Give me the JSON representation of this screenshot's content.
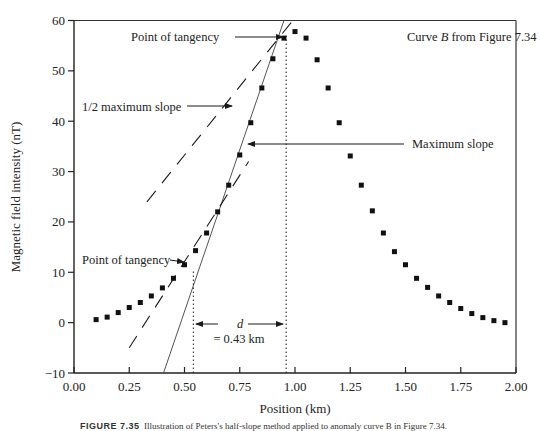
{
  "chart_data": {
    "type": "scatter",
    "title": "",
    "annotation_title": "Curve B from Figure 7.34",
    "xlabel": "Position (km)",
    "ylabel": "Magnetic field intensity (nT)",
    "xlim": [
      0,
      2.0
    ],
    "ylim": [
      -10,
      60
    ],
    "xticks": [
      0.0,
      0.25,
      0.5,
      0.75,
      1.0,
      1.25,
      1.5,
      1.75,
      2.0
    ],
    "xtick_labels": [
      "0.00",
      "0.25",
      "0.50",
      "0.75",
      "1.00",
      "1.25",
      "1.50",
      "1.75",
      "2.00"
    ],
    "yticks": [
      -10,
      0,
      10,
      20,
      30,
      40,
      50,
      60
    ],
    "ytick_labels": [
      "−10",
      "0",
      "10",
      "20",
      "30",
      "40",
      "50",
      "60"
    ],
    "grid": false,
    "series": [
      {
        "name": "Curve B",
        "marker": "square",
        "x": [
          0.1,
          0.15,
          0.2,
          0.25,
          0.3,
          0.35,
          0.4,
          0.45,
          0.5,
          0.55,
          0.6,
          0.65,
          0.7,
          0.75,
          0.8,
          0.85,
          0.9,
          0.95,
          1.0,
          1.05,
          1.1,
          1.15,
          1.2,
          1.25,
          1.3,
          1.35,
          1.4,
          1.45,
          1.5,
          1.55,
          1.6,
          1.65,
          1.7,
          1.75,
          1.8,
          1.85,
          1.9,
          1.95
        ],
        "y": [
          0.6,
          1.1,
          2.0,
          3.0,
          4.0,
          5.3,
          6.9,
          8.8,
          11.5,
          14.3,
          17.8,
          22.0,
          27.3,
          33.3,
          39.7,
          46.6,
          52.4,
          56.5,
          57.8,
          56.5,
          52.2,
          46.6,
          39.7,
          33.1,
          27.3,
          22.2,
          17.8,
          14.1,
          11.5,
          8.8,
          7.0,
          5.3,
          4.0,
          2.8,
          1.8,
          1.0,
          0.4,
          0.0
        ]
      }
    ],
    "lines": [
      {
        "name": "Maximum slope",
        "style": "solid",
        "x": [
          0.405,
          0.95
        ],
        "y": [
          -10,
          60
        ]
      },
      {
        "name": "1/2 maximum slope (upper)",
        "style": "dashed",
        "x": [
          0.33,
          0.99
        ],
        "y": [
          24,
          60
        ]
      },
      {
        "name": "1/2 maximum slope (lower)",
        "style": "dashed",
        "x": [
          0.25,
          0.79
        ],
        "y": [
          -5,
          32
        ]
      }
    ],
    "vlines": [
      {
        "x": 0.54,
        "y": [
          -10,
          10.5
        ],
        "style": "dotted"
      },
      {
        "x": 0.96,
        "y": [
          -10,
          57
        ],
        "style": "dotted"
      }
    ],
    "annotations": [
      {
        "text": "Point of tangency",
        "x": 0.95,
        "y": 56.5
      },
      {
        "text": "1/2 maximum slope",
        "x": 0.74,
        "y": 43
      },
      {
        "text": "Maximum slope",
        "x": 0.78,
        "y": 35
      },
      {
        "text": "Point of tangency",
        "x": 0.5,
        "y": 11.5
      },
      {
        "text": "d",
        "value": "= 0.43 km"
      }
    ]
  },
  "labels": {
    "curve_title_prefix": "Curve ",
    "curve_title_var": "B",
    "curve_title_suffix": " from Figure 7.34",
    "tangency_top": "Point of tangency",
    "half_slope": "1/2 maximum slope",
    "max_slope": "Maximum slope",
    "tangency_bottom": "Point of tangency",
    "d_symbol": "d",
    "d_value": "= 0.43 km",
    "xlabel": "Position (km)",
    "ylabel": "Magnetic field intensity (nT)"
  },
  "caption": {
    "figure_no": "FIGURE 7.35",
    "text": "Illustration of Peters's half-slope method applied to anomaly curve B in Figure 7.34."
  },
  "colors": {
    "ink": "#1a1a1a",
    "line": "#555555",
    "background": "#ffffff"
  }
}
